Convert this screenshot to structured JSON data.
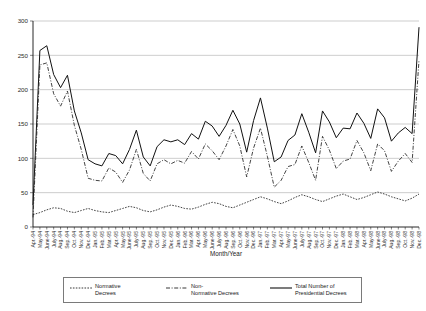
{
  "chart_data": {
    "type": "line",
    "title": "",
    "xlabel": "Month/Year",
    "ylabel": "",
    "ylim": [
      0,
      300
    ],
    "yticks": [
      0,
      50,
      100,
      150,
      200,
      250,
      300
    ],
    "grid": true,
    "legend_position": "bottom",
    "categories": [
      "Apr.-94",
      "May-94",
      "June-94",
      "July-94",
      "Aug.-94",
      "Sep.-94",
      "Oct.-94",
      "Nov.-94",
      "Dec.-94",
      "Jan.-95",
      "Feb.-95",
      "Mar.-95",
      "Apr.-95",
      "May-95",
      "June-95",
      "July-95",
      "Aug.-95",
      "Sep.-95",
      "Oct.-95",
      "Nov.-95",
      "Dec.-95",
      "Jan.-96",
      "Feb.-96",
      "Mar.-96",
      "Apr.-96",
      "May-96",
      "June-96",
      "July-96",
      "Aug.-96",
      "Sep.-96",
      "Oct.-96",
      "Nov.-96",
      "Dec.-96",
      "Jan.-97",
      "Feb.-97",
      "Mar.-97",
      "Apr.-97",
      "May-97",
      "June-97",
      "July-97",
      "Aug.-97",
      "Sep.-97",
      "Oct.-97",
      "Nov.-97",
      "Dec.-97",
      "Jan.-98",
      "Feb.-98",
      "Mar.-98",
      "Apr.-98",
      "May-98",
      "June-98",
      "July-98",
      "Aug.-98",
      "Sep.-98",
      "Oct.-98",
      "Nov.-98",
      "Dec.-98"
    ],
    "series": [
      {
        "name": "Normative Decrees",
        "style": "dotted",
        "values": [
          18,
          21,
          25,
          28,
          27,
          23,
          21,
          24,
          27,
          24,
          22,
          21,
          24,
          27,
          30,
          28,
          24,
          22,
          25,
          29,
          32,
          30,
          27,
          26,
          29,
          33,
          36,
          34,
          30,
          28,
          32,
          36,
          40,
          44,
          41,
          37,
          34,
          38,
          43,
          47,
          44,
          40,
          37,
          41,
          45,
          48,
          44,
          40,
          43,
          47,
          51,
          48,
          44,
          41,
          38,
          42,
          48
        ]
      },
      {
        "name": "Non-Normative Decrees",
        "style": "dash-dot",
        "values": [
          14,
          236,
          239,
          194,
          176,
          198,
          148,
          113,
          71,
          68,
          67,
          86,
          80,
          65,
          83,
          113,
          78,
          67,
          92,
          98,
          92,
          97,
          93,
          110,
          99,
          121,
          111,
          98,
          118,
          142,
          118,
          73,
          115,
          144,
          103,
          58,
          68,
          88,
          91,
          118,
          94,
          68,
          132,
          112,
          85,
          96,
          99,
          126,
          108,
          82,
          121,
          111,
          81,
          96,
          107,
          94,
          243
        ]
      },
      {
        "name": "Total Number of Presidential Decrees",
        "style": "solid",
        "values": [
          32,
          257,
          264,
          222,
          203,
          221,
          169,
          137,
          98,
          92,
          89,
          107,
          104,
          92,
          113,
          141,
          102,
          89,
          117,
          127,
          124,
          127,
          120,
          136,
          128,
          154,
          147,
          132,
          148,
          170,
          150,
          109,
          155,
          188,
          144,
          95,
          102,
          126,
          134,
          165,
          138,
          108,
          169,
          153,
          130,
          144,
          143,
          166,
          151,
          129,
          172,
          159,
          125,
          137,
          145,
          136,
          291
        ]
      }
    ]
  },
  "legend": {
    "entries": [
      {
        "line1": "Normative",
        "line2": "Decrees",
        "swatch": "dotted-line-swatch"
      },
      {
        "line1": "Non-",
        "line2": "Normative Decrees",
        "swatch": "dash-dot-line-swatch"
      },
      {
        "line1": "Total Number of",
        "line2": "Presidential Decrees",
        "swatch": "solid-line-swatch"
      }
    ]
  }
}
